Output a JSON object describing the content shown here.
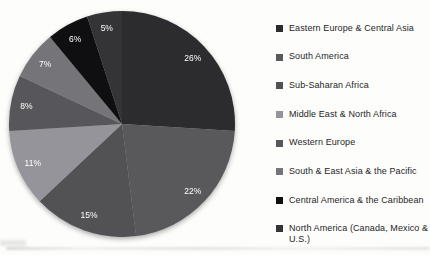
{
  "chart_data": {
    "type": "pie",
    "title": "",
    "categories": [
      "Eastern Europe & Central Asia",
      "South America",
      "Sub-Saharan Africa",
      "Middle East & North Africa",
      "Western Europe",
      "South & East Asia & the Pacific",
      "Central America & the Caribbean",
      "North America (Canada, Mexico & U.S.)"
    ],
    "values": [
      26,
      22,
      15,
      11,
      8,
      7,
      6,
      5
    ],
    "slice_labels": [
      "26%",
      "22%",
      "15%",
      "11%",
      "8%",
      "7%",
      "6%",
      "5%"
    ],
    "colors": [
      "#2c2c2f",
      "#59595c",
      "#525254",
      "#94949a",
      "#57575b",
      "#757579",
      "#0f0f12",
      "#343437"
    ],
    "slice_label_color": "#ffffff",
    "start_angle_deg": 0,
    "direction": "clockwise",
    "legend_position": "right",
    "legend_text_color": "#262626",
    "background_color": "#fdfdfc"
  }
}
